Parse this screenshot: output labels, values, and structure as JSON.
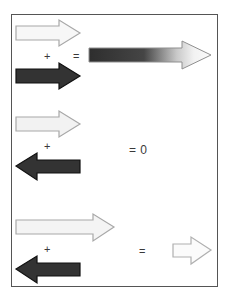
{
  "figure": {
    "background_color": "#ffffff",
    "border_color": "#555555",
    "frame": {
      "x": 11,
      "y": 14,
      "width": 207,
      "height": 273
    },
    "operators": {
      "plus": "+",
      "equals": "=",
      "zero": "0",
      "equals_zero": "= 0"
    },
    "colors": {
      "dark_arrow_fill": "#333333",
      "dark_arrow_stroke": "#111111",
      "light_arrow_fill": "#f5f5f5",
      "light_arrow_stroke": "#a8a8a8",
      "gradient_start": "#2e2e2e",
      "gradient_end": "#fafafa",
      "text_color": "#3a3a3a"
    },
    "rows": [
      {
        "id": "row-1",
        "description": "same-direction addition",
        "operand_1": {
          "name": "light-arrow-right-medium",
          "direction": "right",
          "shade": "light",
          "length": 66
        },
        "operator": "+",
        "operand_2": {
          "name": "dark-arrow-right-medium",
          "direction": "right",
          "shade": "dark",
          "length": 66
        },
        "equals": "=",
        "result": {
          "name": "gradient-arrow-right-long",
          "direction": "right",
          "shade": "gradient",
          "length": 124
        }
      },
      {
        "id": "row-2",
        "description": "equal and opposite cancel to zero",
        "operand_1": {
          "name": "light-arrow-right-medium",
          "direction": "right",
          "shade": "light",
          "length": 66
        },
        "operator": "+",
        "operand_2": {
          "name": "dark-arrow-left-medium",
          "direction": "left",
          "shade": "dark",
          "length": 66
        },
        "equals": "= 0",
        "result": {
          "name": "zero-result",
          "direction": "none",
          "shade": "none",
          "length": 0
        }
      },
      {
        "id": "row-3",
        "description": "unequal opposite gives small net arrow",
        "operand_1": {
          "name": "light-arrow-right-long",
          "direction": "right",
          "shade": "light",
          "length": 100
        },
        "operator": "+",
        "operand_2": {
          "name": "dark-arrow-left-medium",
          "direction": "left",
          "shade": "dark",
          "length": 66
        },
        "equals": "=",
        "result": {
          "name": "light-arrow-right-short",
          "direction": "right",
          "shade": "light",
          "length": 40
        }
      }
    ]
  }
}
